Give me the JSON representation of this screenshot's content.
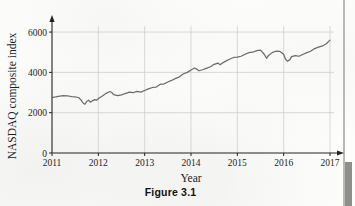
{
  "figure": {
    "caption": "Figure 3.1"
  },
  "chart_data": {
    "type": "line",
    "title": "",
    "xlabel": "Year",
    "ylabel": "NASDAQ composite index",
    "xlim": [
      2011,
      2017
    ],
    "ylim": [
      0,
      6400
    ],
    "xticks": [
      2011,
      2012,
      2013,
      2014,
      2015,
      2016,
      2017
    ],
    "xtick_labels": [
      "2011",
      "2012",
      "2013",
      "2014",
      "2015",
      "2016",
      "2017"
    ],
    "yticks": [
      0,
      2000,
      4000,
      6000
    ],
    "ytick_labels": [
      "0",
      "2000",
      "4000",
      "6000"
    ],
    "grid": "horizontal-and-vertical-light",
    "legend": "none",
    "line_color": "#6b6b6b",
    "axis_color": "#222222",
    "grid_color": "#c9c9c4",
    "series": [
      {
        "name": "NASDAQ composite index",
        "x": [
          2011.0,
          2011.08,
          2011.17,
          2011.25,
          2011.33,
          2011.42,
          2011.5,
          2011.58,
          2011.63,
          2011.67,
          2011.71,
          2011.75,
          2011.79,
          2011.83,
          2011.88,
          2011.92,
          2011.96,
          2012.0,
          2012.08,
          2012.17,
          2012.25,
          2012.29,
          2012.33,
          2012.42,
          2012.5,
          2012.58,
          2012.67,
          2012.75,
          2012.83,
          2012.92,
          2013.0,
          2013.08,
          2013.17,
          2013.25,
          2013.33,
          2013.42,
          2013.5,
          2013.58,
          2013.67,
          2013.75,
          2013.83,
          2013.92,
          2014.0,
          2014.08,
          2014.13,
          2014.17,
          2014.25,
          2014.33,
          2014.42,
          2014.5,
          2014.58,
          2014.63,
          2014.67,
          2014.75,
          2014.83,
          2014.92,
          2015.0,
          2015.08,
          2015.17,
          2015.25,
          2015.33,
          2015.42,
          2015.5,
          2015.58,
          2015.63,
          2015.67,
          2015.75,
          2015.83,
          2015.92,
          2016.0,
          2016.04,
          2016.08,
          2016.13,
          2016.17,
          2016.25,
          2016.33,
          2016.42,
          2016.5,
          2016.58,
          2016.67,
          2016.75,
          2016.83,
          2016.92,
          2017.0
        ],
        "values": [
          2750,
          2780,
          2820,
          2850,
          2840,
          2800,
          2790,
          2740,
          2620,
          2480,
          2420,
          2560,
          2620,
          2520,
          2600,
          2650,
          2620,
          2700,
          2820,
          2960,
          3050,
          3000,
          2900,
          2850,
          2880,
          2950,
          3020,
          2990,
          3060,
          3020,
          3100,
          3180,
          3250,
          3270,
          3400,
          3430,
          3520,
          3600,
          3700,
          3780,
          3920,
          4000,
          4120,
          4220,
          4150,
          4080,
          4130,
          4200,
          4280,
          4400,
          4460,
          4380,
          4450,
          4560,
          4650,
          4740,
          4760,
          4800,
          4900,
          4980,
          5000,
          5080,
          5100,
          4900,
          4700,
          4830,
          4980,
          5050,
          5040,
          4900,
          4650,
          4560,
          4620,
          4780,
          4830,
          4800,
          4900,
          4980,
          5050,
          5180,
          5250,
          5300,
          5420,
          5600
        ]
      }
    ]
  }
}
